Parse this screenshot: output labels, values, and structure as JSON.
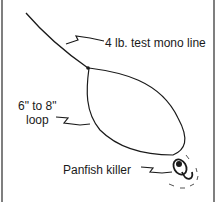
{
  "diagram": {
    "type": "fishing-rig-illustration",
    "labels": {
      "line": "4 lb. test mono line",
      "loop_line1": "6\" to 8\"",
      "loop_line2": "loop",
      "lure": "Panfish killer"
    },
    "colors": {
      "ink": "#1a1a1a",
      "border": "#555555",
      "background": "#ffffff"
    }
  }
}
